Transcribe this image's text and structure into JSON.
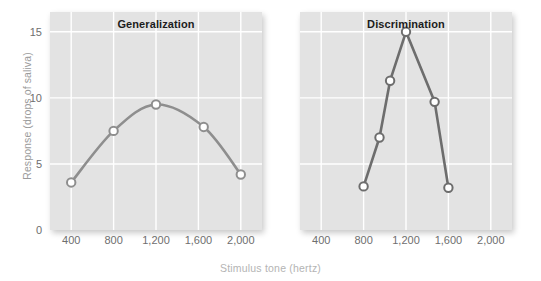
{
  "chart_data": {
    "type": "line",
    "title": "",
    "xlabel": "Stimulus tone (hertz)",
    "ylabel": "Response (drops of saliva)",
    "xlim": [
      200,
      2200
    ],
    "ylim": [
      0,
      16.5
    ],
    "grid": true,
    "legend": "none",
    "x_ticks": [
      {
        "value": 400,
        "label": "400"
      },
      {
        "value": 800,
        "label": "800"
      },
      {
        "value": 1200,
        "label": "1,200"
      },
      {
        "value": 1600,
        "label": "1,600"
      },
      {
        "value": 2000,
        "label": "2,000"
      }
    ],
    "y_ticks": [
      {
        "value": 0,
        "label": "0"
      },
      {
        "value": 5,
        "label": "5"
      },
      {
        "value": 10,
        "label": "10"
      },
      {
        "value": 15,
        "label": "15"
      }
    ],
    "panels": [
      {
        "name": "generalization",
        "title": "Generalization",
        "line_color": "#8e8e8e",
        "marker_fill": "#ffffff",
        "curve": "smooth",
        "points": [
          {
            "x": 400,
            "y": 3.6
          },
          {
            "x": 800,
            "y": 7.5
          },
          {
            "x": 1200,
            "y": 9.5
          },
          {
            "x": 1650,
            "y": 7.8
          },
          {
            "x": 2000,
            "y": 4.2
          }
        ]
      },
      {
        "name": "discrimination",
        "title": "Discrimination",
        "line_color": "#6d6d6d",
        "marker_fill": "#ffffff",
        "curve": "sharp",
        "points": [
          {
            "x": 800,
            "y": 3.3
          },
          {
            "x": 950,
            "y": 7.0
          },
          {
            "x": 1050,
            "y": 11.3
          },
          {
            "x": 1200,
            "y": 15.0
          },
          {
            "x": 1470,
            "y": 9.7
          },
          {
            "x": 1600,
            "y": 3.2
          }
        ]
      }
    ],
    "colors": {
      "plot_background": "#e3e3e3",
      "gridline": "#ffffff",
      "page_background": "#ffffff",
      "tick_label": "#6e6e6e",
      "axis_title": "#a8a8a8"
    }
  }
}
